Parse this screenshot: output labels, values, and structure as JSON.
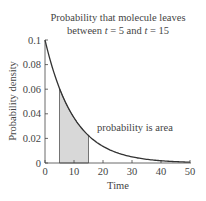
{
  "title": {
    "line1": "Probability that molecule leaves",
    "line2_pre": "between ",
    "line2_t1": "t",
    "line2_mid": " = 5 and ",
    "line2_t2": "t",
    "line2_post": " = 15"
  },
  "annotation": "probability is area",
  "chart_data": {
    "type": "area",
    "title": "Probability that molecule leaves between t = 5 and t = 15",
    "xlabel": "Time",
    "ylabel": "Probability density",
    "xlim": [
      0,
      50
    ],
    "ylim": [
      0,
      0.1
    ],
    "xticks": [
      "0",
      "10",
      "20",
      "30",
      "40",
      "50"
    ],
    "yticks": [
      "0",
      "0.02",
      "0.04",
      "0.06",
      "0.08",
      "0.1"
    ],
    "function": "0.1*exp(-0.1*t)",
    "x": [
      0,
      5,
      10,
      15,
      20,
      25,
      30,
      35,
      40,
      45,
      50
    ],
    "values": [
      0.1,
      0.0607,
      0.0368,
      0.0223,
      0.0135,
      0.0082,
      0.005,
      0.003,
      0.0018,
      0.0011,
      0.0007
    ],
    "shaded_region": [
      5,
      15
    ],
    "annotations": [
      "probability is area"
    ],
    "grid": false
  }
}
